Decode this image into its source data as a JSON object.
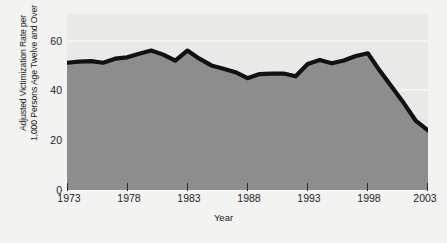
{
  "chart_data": {
    "type": "area",
    "title": "",
    "xlabel": "Year",
    "ylabel": "Adjusted Victimization Rate per\n1,000 Persons Age Twelve and Over",
    "xlim": [
      1973,
      2003
    ],
    "ylim": [
      0,
      65
    ],
    "grid": true,
    "legend": "none",
    "y_ticks": [
      0,
      20,
      40,
      60
    ],
    "y_tick_labels": [
      "0",
      "20",
      "40",
      "60"
    ],
    "x_ticks": [
      1973,
      1978,
      1983,
      1988,
      1993,
      1998,
      2003
    ],
    "x_tick_labels": [
      "1973",
      "1978",
      "1983",
      "1988",
      "1993",
      "1998",
      "2003"
    ],
    "series_name": "Adjusted Victimization Rate",
    "x": [
      1973,
      1974,
      1975,
      1976,
      1977,
      1978,
      1979,
      1980,
      1981,
      1982,
      1983,
      1984,
      1985,
      1986,
      1987,
      1988,
      1989,
      1990,
      1991,
      1992,
      1993,
      1994,
      1995,
      1996,
      1997,
      1998,
      1999,
      2000,
      2001,
      2002,
      2003
    ],
    "values": [
      47.0,
      47.4,
      47.6,
      47.0,
      48.5,
      49.0,
      50.3,
      51.5,
      50.0,
      47.8,
      51.5,
      48.5,
      46.0,
      44.8,
      43.5,
      41.3,
      42.8,
      43.0,
      43.0,
      42.0,
      46.5,
      48.0,
      46.8,
      47.8,
      49.5,
      50.5,
      44.0,
      38.0,
      32.0,
      25.5,
      22.0
    ],
    "colors": {
      "plot_background": "#e9e9e7",
      "area_fill": "#8d8d8d",
      "line": "#111111",
      "gridline": "#f4f4f2",
      "page_background": "#f3f3f1",
      "axis_text": "#1d1d1d"
    }
  }
}
